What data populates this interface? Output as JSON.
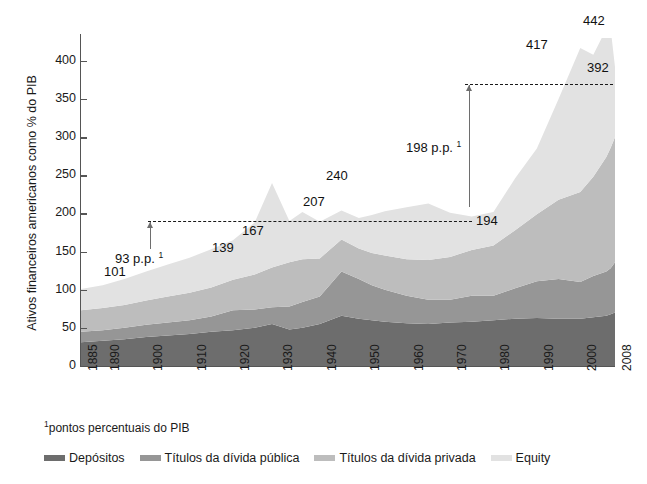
{
  "title": "O crescimento dos ativos financeiros norte-americanos",
  "footnote": "pontos percentuais do PIB",
  "footnote_marker": "1",
  "legend": {
    "items": [
      {
        "label": "Depósitos",
        "color": "#6d6d6d"
      },
      {
        "label": "Títulos da dívida pública",
        "color": "#969696"
      },
      {
        "label": "Títulos da dívida privada",
        "color": "#bdbdbd"
      },
      {
        "label": "Equity",
        "color": "#e2e2e2"
      }
    ]
  },
  "annotations": [
    {
      "name": "value-101",
      "text": "101",
      "x": 104,
      "y": 264
    },
    {
      "name": "value-139",
      "text": "139",
      "x": 212,
      "y": 240
    },
    {
      "name": "value-167",
      "text": "167",
      "x": 242,
      "y": 223
    },
    {
      "name": "value-207",
      "text": "207",
      "x": 303,
      "y": 194
    },
    {
      "name": "value-240",
      "text": "240",
      "x": 326,
      "y": 168
    },
    {
      "name": "value-194",
      "text": "194",
      "x": 476,
      "y": 213
    },
    {
      "name": "value-417",
      "text": "417",
      "x": 526,
      "y": 37
    },
    {
      "name": "value-442",
      "text": "442",
      "x": 583,
      "y": 13
    },
    {
      "name": "value-392",
      "text": "392",
      "x": 587,
      "y": 60
    }
  ],
  "delta_labels": [
    {
      "name": "delta-93",
      "value": "93",
      "unit": "p.p.",
      "marker": "1",
      "x": 115,
      "y": 250
    },
    {
      "name": "delta-198",
      "value": "198",
      "unit": "p.p.",
      "marker": "1",
      "x": 406,
      "y": 139
    }
  ],
  "chart_data": {
    "type": "area",
    "title": "O crescimento dos ativos financeiros norte-americanos",
    "xlabel": "",
    "ylabel": "Ativos financeiros americanos como % do PIB",
    "ylim": [
      0,
      430
    ],
    "yticks": [
      0,
      50,
      100,
      150,
      200,
      250,
      300,
      350,
      400
    ],
    "xticks": [
      1885,
      1890,
      1900,
      1910,
      1920,
      1930,
      1940,
      1950,
      1960,
      1970,
      1980,
      1990,
      2000,
      2008
    ],
    "xlim": [
      1885,
      2008
    ],
    "grid": false,
    "legend_position": "bottom",
    "stacked": true,
    "x": [
      1885,
      1890,
      1895,
      1900,
      1905,
      1910,
      1915,
      1920,
      1925,
      1929,
      1933,
      1936,
      1940,
      1945,
      1949,
      1952,
      1955,
      1960,
      1965,
      1970,
      1975,
      1980,
      1985,
      1990,
      1995,
      2000,
      2003,
      2006,
      2007,
      2008
    ],
    "series": [
      {
        "name": "Depósitos",
        "color": "#6d6d6d",
        "values": [
          31,
          33,
          35,
          38,
          40,
          42,
          45,
          47,
          50,
          55,
          48,
          50,
          55,
          66,
          62,
          60,
          58,
          56,
          55,
          57,
          58,
          60,
          62,
          63,
          62,
          62,
          64,
          66,
          68,
          70
        ]
      },
      {
        "name": "Títulos da dívida pública",
        "color": "#969696",
        "values": [
          14,
          14,
          15,
          16,
          17,
          18,
          20,
          26,
          24,
          22,
          30,
          34,
          36,
          58,
          52,
          46,
          42,
          36,
          32,
          30,
          34,
          32,
          40,
          48,
          52,
          48,
          54,
          58,
          60,
          66
        ]
      },
      {
        "name": "Títulos da dívida privada",
        "color": "#bdbdbd",
        "values": [
          28,
          29,
          30,
          32,
          34,
          36,
          38,
          40,
          46,
          52,
          58,
          56,
          50,
          42,
          40,
          42,
          45,
          48,
          52,
          56,
          60,
          66,
          76,
          88,
          104,
          118,
          130,
          150,
          158,
          164
        ]
      },
      {
        "name": "Equity",
        "color": "#e2e2e2",
        "values": [
          28,
          30,
          34,
          38,
          42,
          46,
          50,
          52,
          68,
          111,
          54,
          62,
          48,
          38,
          40,
          50,
          58,
          68,
          74,
          58,
          44,
          44,
          68,
          86,
          132,
          189,
          160,
          168,
          156,
          92
        ]
      }
    ],
    "totals_highlighted": [
      {
        "label": "101",
        "year": 1900
      },
      {
        "label": "139",
        "year": 1920
      },
      {
        "label": "167",
        "year": 1929
      },
      {
        "label": "207",
        "year": 1933
      },
      {
        "label": "240",
        "year": 1949
      },
      {
        "label": "194",
        "year": 1980
      },
      {
        "label": "417",
        "year": 2000
      },
      {
        "label": "442",
        "year": 2007
      },
      {
        "label": "392",
        "year": 2008
      }
    ],
    "reference_lines": [
      {
        "name": "ref-194",
        "value": 194,
        "style": "dashed"
      },
      {
        "name": "ref-392",
        "value": 392,
        "style": "dashed"
      }
    ],
    "deltas": [
      {
        "name": "delta-93",
        "value": 93,
        "unit": "p.p.",
        "from_year": 1900,
        "to_year": 1980
      },
      {
        "name": "delta-198",
        "value": 198,
        "unit": "p.p.",
        "from_year": 1980,
        "to_year": 2008
      }
    ]
  }
}
